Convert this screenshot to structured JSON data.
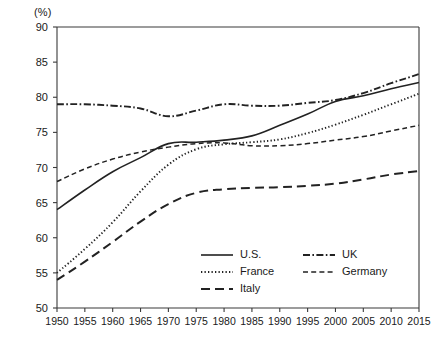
{
  "chart_data": {
    "type": "line",
    "title": "",
    "subtitle": "",
    "unit_label": "(%)",
    "xlabel": "",
    "ylabel": "",
    "xlim": [
      1950,
      2015
    ],
    "ylim": [
      50,
      90
    ],
    "ytick_step": 5,
    "xtick_step": 5,
    "grid": false,
    "legend_position": "inside-bottom-center",
    "x": [
      1950,
      1955,
      1960,
      1965,
      1970,
      1975,
      1980,
      1985,
      1990,
      1995,
      2000,
      2005,
      2010,
      2015
    ],
    "xticklabels": [
      "1950",
      "1955",
      "1960",
      "1965",
      "1970",
      "1975",
      "1980",
      "1985",
      "1990",
      "1995",
      "2000",
      "2005",
      "2010",
      "2015"
    ],
    "yticklabels": [
      "50",
      "55",
      "60",
      "65",
      "70",
      "75",
      "80",
      "85",
      "90"
    ],
    "yticks": [
      50,
      55,
      60,
      65,
      70,
      75,
      80,
      85,
      90
    ],
    "series": [
      {
        "name": "U.S.",
        "style": "solid",
        "values": [
          64.0,
          66.8,
          69.4,
          71.4,
          73.4,
          73.6,
          73.9,
          74.5,
          76.0,
          77.6,
          79.4,
          80.2,
          81.2,
          82.1
        ]
      },
      {
        "name": "UK",
        "style": "dash-dot",
        "values": [
          79.0,
          79.0,
          78.8,
          78.4,
          77.3,
          78.1,
          79.0,
          78.8,
          78.8,
          79.2,
          79.6,
          80.6,
          82.0,
          83.3
        ]
      },
      {
        "name": "France",
        "style": "dotted",
        "values": [
          55.0,
          58.4,
          62.2,
          66.6,
          70.4,
          72.6,
          73.3,
          73.6,
          74.0,
          74.9,
          76.1,
          77.5,
          79.0,
          80.5
        ]
      },
      {
        "name": "Germany",
        "style": "dashed",
        "values": [
          68.0,
          69.8,
          71.2,
          72.2,
          72.9,
          73.4,
          73.5,
          73.1,
          73.1,
          73.4,
          73.9,
          74.4,
          75.2,
          76.0
        ]
      },
      {
        "name": "Italy",
        "style": "long-dash",
        "values": [
          54.0,
          56.6,
          59.4,
          62.3,
          64.8,
          66.4,
          66.9,
          67.1,
          67.2,
          67.4,
          67.7,
          68.3,
          69.0,
          69.5
        ]
      }
    ],
    "legend": [
      {
        "label": "U.S.",
        "style": "solid",
        "column": 0,
        "row": 0
      },
      {
        "label": "UK",
        "style": "dash-dot",
        "column": 1,
        "row": 0
      },
      {
        "label": "France",
        "style": "dotted",
        "column": 0,
        "row": 1
      },
      {
        "label": "Germany",
        "style": "dashed",
        "column": 1,
        "row": 1
      },
      {
        "label": "Italy",
        "style": "long-dash",
        "column": 0,
        "row": 2
      }
    ],
    "colors": {
      "axis": "#3a3a3a",
      "line": "#222222",
      "background": "#ffffff",
      "text": "#1a1a1a"
    }
  }
}
